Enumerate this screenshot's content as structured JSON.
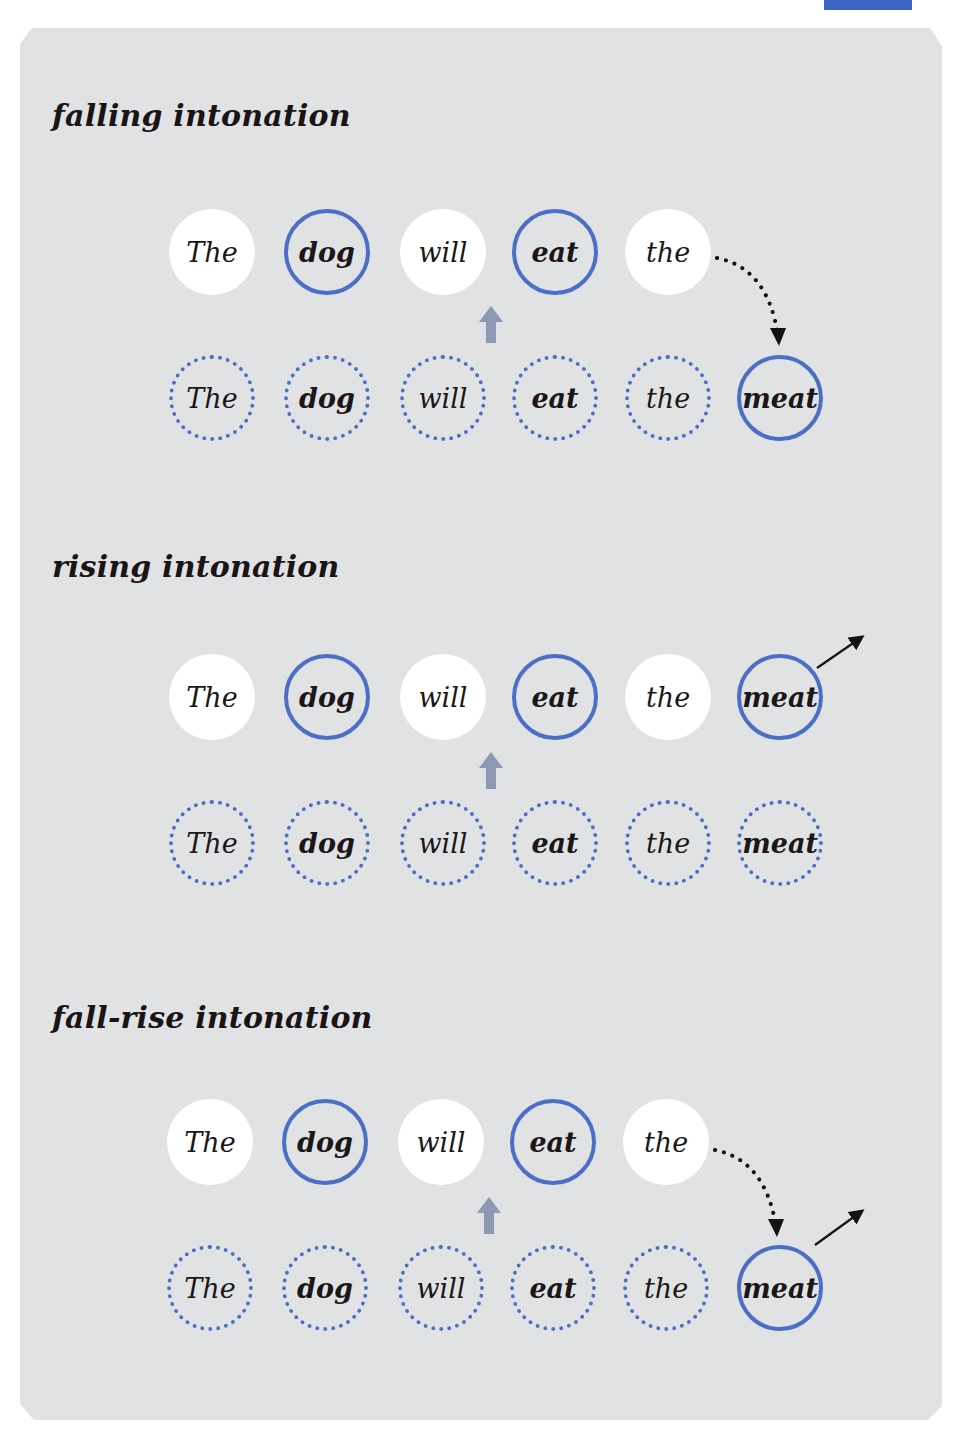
{
  "colors": {
    "panel_bg": "#e1e2e4",
    "circle_blue": "#4a6fc4",
    "up_arrow": "#8c98b4",
    "text": "#1b1719",
    "tab_blue": "#3a63c4"
  },
  "sections": [
    {
      "title": "falling intonation",
      "tone_arrows": [
        "falling-dotted-curve"
      ],
      "top_row": [
        {
          "text": "The",
          "style": "plain"
        },
        {
          "text": "dog",
          "style": "stressed"
        },
        {
          "text": "will",
          "style": "plain"
        },
        {
          "text": "eat",
          "style": "stressed"
        },
        {
          "text": "the",
          "style": "plain"
        }
      ],
      "bottom_row": [
        {
          "text": "The",
          "style": "dotted"
        },
        {
          "text": "dog",
          "style": "dotted"
        },
        {
          "text": "will",
          "style": "dotted"
        },
        {
          "text": "eat",
          "style": "dotted"
        },
        {
          "text": "the",
          "style": "dotted"
        },
        {
          "text": "meat",
          "style": "tonic"
        }
      ]
    },
    {
      "title": "rising intonation",
      "tone_arrows": [
        "rising-arrow"
      ],
      "top_row": [
        {
          "text": "The",
          "style": "plain"
        },
        {
          "text": "dog",
          "style": "stressed"
        },
        {
          "text": "will",
          "style": "plain"
        },
        {
          "text": "eat",
          "style": "stressed"
        },
        {
          "text": "the",
          "style": "plain"
        },
        {
          "text": "meat",
          "style": "tonic"
        }
      ],
      "bottom_row": [
        {
          "text": "The",
          "style": "dotted"
        },
        {
          "text": "dog",
          "style": "dotted"
        },
        {
          "text": "will",
          "style": "dotted"
        },
        {
          "text": "eat",
          "style": "dotted"
        },
        {
          "text": "the",
          "style": "dotted"
        },
        {
          "text": "meat",
          "style": "dotted"
        }
      ]
    },
    {
      "title": "fall-rise intonation",
      "tone_arrows": [
        "falling-dotted-curve",
        "rising-arrow"
      ],
      "top_row": [
        {
          "text": "The",
          "style": "plain"
        },
        {
          "text": "dog",
          "style": "stressed"
        },
        {
          "text": "will",
          "style": "plain"
        },
        {
          "text": "eat",
          "style": "stressed"
        },
        {
          "text": "the",
          "style": "plain"
        }
      ],
      "bottom_row": [
        {
          "text": "The",
          "style": "dotted"
        },
        {
          "text": "dog",
          "style": "dotted"
        },
        {
          "text": "will",
          "style": "dotted"
        },
        {
          "text": "eat",
          "style": "dotted"
        },
        {
          "text": "the",
          "style": "dotted"
        },
        {
          "text": "meat",
          "style": "tonic"
        }
      ]
    }
  ]
}
